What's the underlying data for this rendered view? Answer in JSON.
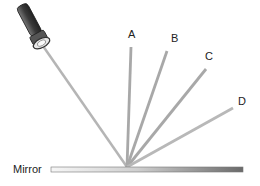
{
  "diagram": {
    "labels": {
      "a": "A",
      "b": "B",
      "c": "C",
      "d": "D",
      "mirror": "Mirror"
    },
    "objects": {
      "light_source": "torch-icon",
      "surface": "mirror"
    },
    "rays": [
      {
        "id": "incident",
        "from": "torch",
        "to": "mirror-point"
      },
      {
        "id": "A",
        "from": "mirror-point",
        "to": "A"
      },
      {
        "id": "B",
        "from": "mirror-point",
        "to": "B"
      },
      {
        "id": "C",
        "from": "mirror-point",
        "to": "C"
      },
      {
        "id": "D",
        "from": "mirror-point",
        "to": "D"
      }
    ],
    "colors": {
      "ray": "#a6a6a6",
      "mirror_light": "#f4f4f4",
      "mirror_dark": "#6e6e6e",
      "torch_body": "#4a4a4a"
    }
  }
}
